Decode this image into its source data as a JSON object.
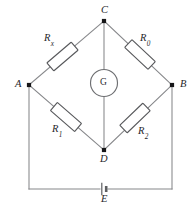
{
  "figure": {
    "background_color": "#ffffff",
    "wire_color": "#86878a",
    "ink_color": "#262629"
  },
  "nodes": [
    {
      "id": "C",
      "label": "C",
      "x": 104,
      "y": 21,
      "label_x": 101,
      "label_y": 5
    },
    {
      "id": "A",
      "label": "A",
      "x": 29,
      "y": 85,
      "label_x": 15,
      "label_y": 79
    },
    {
      "id": "B",
      "label": "B",
      "x": 172,
      "y": 85,
      "label_x": 180,
      "label_y": 79
    },
    {
      "id": "D",
      "label": "D",
      "x": 104,
      "y": 150,
      "label_x": 100,
      "label_y": 154
    }
  ],
  "resistors": [
    {
      "id": "Rx",
      "name": "R",
      "subscript": "x",
      "branch": "A-C",
      "label_x": 44,
      "label_y": 33
    },
    {
      "id": "R0",
      "name": "R",
      "subscript": "0",
      "branch": "C-B",
      "label_x": 140,
      "label_y": 33
    },
    {
      "id": "R1",
      "name": "R",
      "subscript": "1",
      "branch": "A-D",
      "label_x": 52,
      "label_y": 124
    },
    {
      "id": "R2",
      "name": "R",
      "subscript": "2",
      "branch": "D-B",
      "label_x": 138,
      "label_y": 126
    }
  ],
  "meter": {
    "id": "G",
    "label": "G",
    "type": "galvanometer",
    "branch": "C-D",
    "cx": 104,
    "cy": 83,
    "r": 13.5,
    "label_x": 100,
    "label_y": 78
  },
  "source": {
    "id": "E",
    "label": "E",
    "type": "battery-cell",
    "branch": "A-B outer loop",
    "x": 104,
    "y": 189,
    "label_x": 101,
    "label_y": 194
  }
}
